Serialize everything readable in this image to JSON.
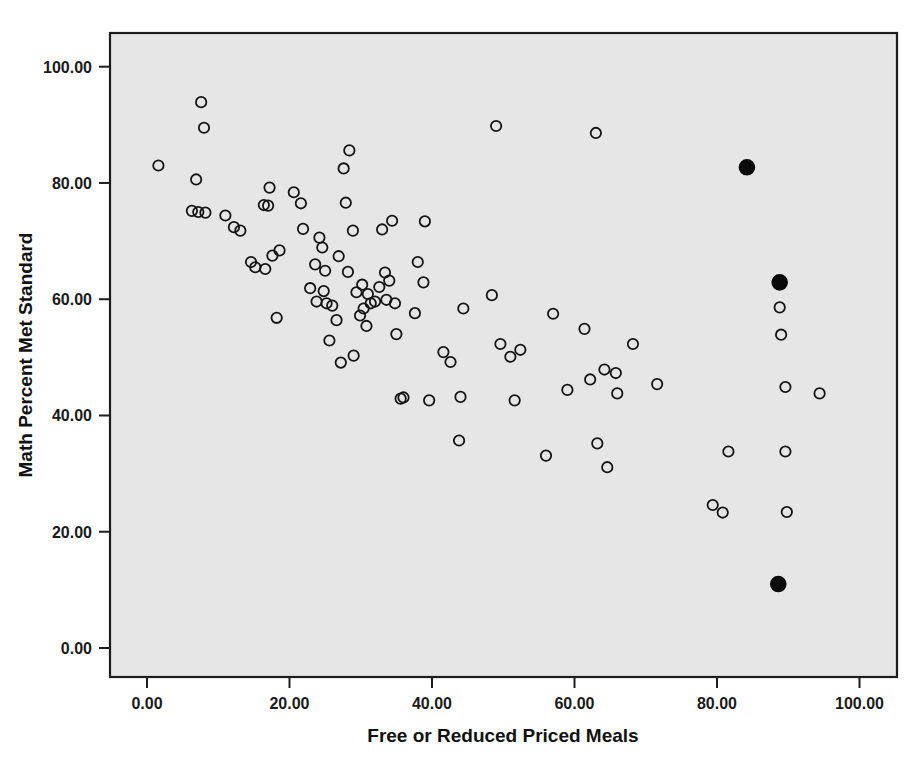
{
  "chart_data": {
    "type": "scatter",
    "title": "",
    "xlabel": "Free or Reduced Priced Meals",
    "ylabel": "Math Percent Met Standard",
    "xlim": [
      -6.5,
      106.5
    ],
    "ylim": [
      -7.0,
      107.5
    ],
    "grid": false,
    "legend": null,
    "background": "#e6e6e6",
    "marker_colors": {
      "open": "#141414",
      "filled": "#0a0a0a"
    },
    "xticks": [
      0,
      20,
      40,
      60,
      80,
      100
    ],
    "xtick_labels": [
      "0.00",
      "20.00",
      "40.00",
      "60.00",
      "80.00",
      "100.00"
    ],
    "yticks": [
      0,
      20,
      40,
      60,
      80,
      100
    ],
    "ytick_labels": [
      "0.00",
      "20.00",
      "40.00",
      "60.00",
      "80.00",
      "100.00"
    ],
    "series": [
      {
        "name": "schools-open",
        "marker": "open-circle",
        "points": [
          [
            1.6,
            83.0
          ],
          [
            7.6,
            93.9
          ],
          [
            8.0,
            89.5
          ],
          [
            6.9,
            80.6
          ],
          [
            6.3,
            75.2
          ],
          [
            7.2,
            75.0
          ],
          [
            8.2,
            74.9
          ],
          [
            11.0,
            74.4
          ],
          [
            12.2,
            72.4
          ],
          [
            13.1,
            71.8
          ],
          [
            14.6,
            66.4
          ],
          [
            15.2,
            65.5
          ],
          [
            16.6,
            65.2
          ],
          [
            17.2,
            79.2
          ],
          [
            16.4,
            76.2
          ],
          [
            17.0,
            76.1
          ],
          [
            17.6,
            67.5
          ],
          [
            18.6,
            68.4
          ],
          [
            18.2,
            56.8
          ],
          [
            20.6,
            78.4
          ],
          [
            21.6,
            76.5
          ],
          [
            21.9,
            72.1
          ],
          [
            24.2,
            70.6
          ],
          [
            24.6,
            68.9
          ],
          [
            23.6,
            66.0
          ],
          [
            25.0,
            64.9
          ],
          [
            25.6,
            52.9
          ],
          [
            22.9,
            61.9
          ],
          [
            23.8,
            59.6
          ],
          [
            24.8,
            61.4
          ],
          [
            25.2,
            59.3
          ],
          [
            26.0,
            58.9
          ],
          [
            26.6,
            56.4
          ],
          [
            27.6,
            82.5
          ],
          [
            28.4,
            85.6
          ],
          [
            27.9,
            76.6
          ],
          [
            28.9,
            71.8
          ],
          [
            26.9,
            67.4
          ],
          [
            28.2,
            64.7
          ],
          [
            27.2,
            49.1
          ],
          [
            29.4,
            61.2
          ],
          [
            30.2,
            62.5
          ],
          [
            31.0,
            60.9
          ],
          [
            31.4,
            59.3
          ],
          [
            30.4,
            58.4
          ],
          [
            29.9,
            57.2
          ],
          [
            30.8,
            55.4
          ],
          [
            32.0,
            59.6
          ],
          [
            32.6,
            62.1
          ],
          [
            29.0,
            50.3
          ],
          [
            33.0,
            72.0
          ],
          [
            34.4,
            73.5
          ],
          [
            33.4,
            64.6
          ],
          [
            34.0,
            63.2
          ],
          [
            33.6,
            59.9
          ],
          [
            34.8,
            59.3
          ],
          [
            35.0,
            54.0
          ],
          [
            35.6,
            42.9
          ],
          [
            36.0,
            43.1
          ],
          [
            38.0,
            66.4
          ],
          [
            38.8,
            62.9
          ],
          [
            37.6,
            57.6
          ],
          [
            39.0,
            73.4
          ],
          [
            39.6,
            42.6
          ],
          [
            41.6,
            50.9
          ],
          [
            42.6,
            49.2
          ],
          [
            43.8,
            35.7
          ],
          [
            44.4,
            58.4
          ],
          [
            44.0,
            43.2
          ],
          [
            49.0,
            89.8
          ],
          [
            48.4,
            60.7
          ],
          [
            49.6,
            52.3
          ],
          [
            51.0,
            50.1
          ],
          [
            52.4,
            51.3
          ],
          [
            51.6,
            42.6
          ],
          [
            56.0,
            33.1
          ],
          [
            57.0,
            57.5
          ],
          [
            59.0,
            44.4
          ],
          [
            61.4,
            54.9
          ],
          [
            63.0,
            88.6
          ],
          [
            62.2,
            46.2
          ],
          [
            63.2,
            35.2
          ],
          [
            64.2,
            47.9
          ],
          [
            64.6,
            31.1
          ],
          [
            65.8,
            47.3
          ],
          [
            66.0,
            43.8
          ],
          [
            68.2,
            52.3
          ],
          [
            71.6,
            45.4
          ],
          [
            79.4,
            24.6
          ],
          [
            80.8,
            23.3
          ],
          [
            81.6,
            33.8
          ],
          [
            88.8,
            58.6
          ],
          [
            89.0,
            53.9
          ],
          [
            89.6,
            44.9
          ],
          [
            89.6,
            33.8
          ],
          [
            89.8,
            23.4
          ],
          [
            94.4,
            43.8
          ]
        ]
      },
      {
        "name": "highlighted-schools-filled",
        "marker": "filled-circle",
        "points": [
          [
            84.2,
            82.7
          ],
          [
            88.8,
            62.9
          ],
          [
            88.6,
            11.0
          ]
        ]
      }
    ]
  },
  "figure": {
    "plot_area": {
      "x": 110,
      "y": 33,
      "width": 787,
      "height": 644
    },
    "axis_calibration": {
      "x_origin_px": 147,
      "x_px_per_unit": 7.125,
      "y_origin_px": 648,
      "y_px_per_unit": 5.813
    }
  }
}
